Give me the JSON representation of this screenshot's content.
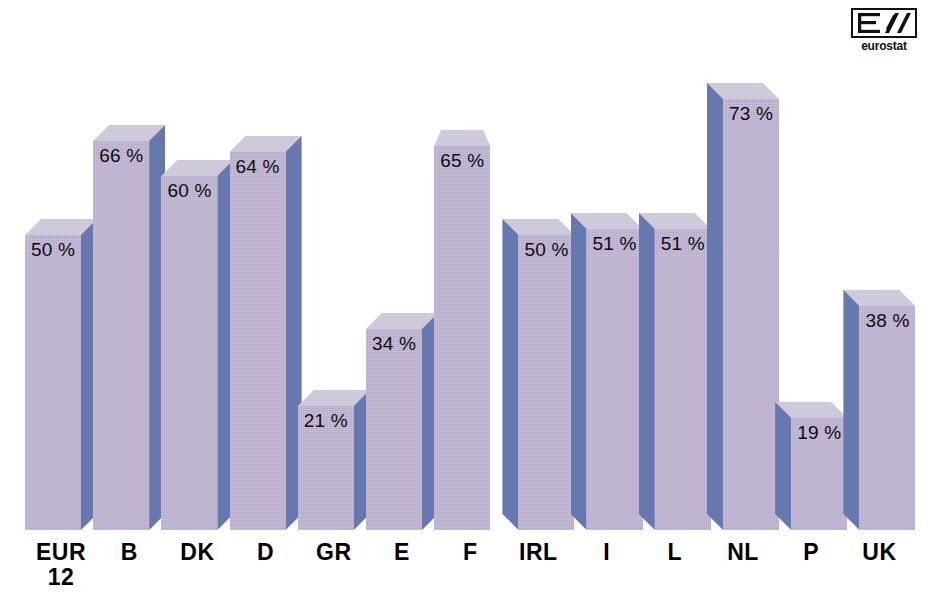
{
  "chart_data": {
    "type": "bar",
    "title": "",
    "subtitle": "",
    "xlabel": "",
    "ylabel": "",
    "ylim": [
      0,
      80
    ],
    "grid": false,
    "legend": null,
    "value_suffix": "%",
    "categories": [
      "EUR 12",
      "B",
      "DK",
      "D",
      "GR",
      "E",
      "F",
      "IRL",
      "I",
      "L",
      "NL",
      "P",
      "UK"
    ],
    "values": [
      50,
      66,
      60,
      64,
      21,
      34,
      65,
      50,
      51,
      51,
      73,
      19,
      38
    ],
    "data_labels": [
      "50 %",
      "66 %",
      "60 %",
      "64 %",
      "21 %",
      "34 %",
      "65 %",
      "50 %",
      "51 %",
      "51 %",
      "73 %",
      "19 %",
      "38 %"
    ],
    "bars": [
      {
        "category_line1": "EUR",
        "category_line2": "12",
        "value": 50,
        "label": "50 %",
        "side": "right"
      },
      {
        "category_line1": "B",
        "category_line2": "",
        "value": 66,
        "label": "66 %",
        "side": "right"
      },
      {
        "category_line1": "DK",
        "category_line2": "",
        "value": 60,
        "label": "60 %",
        "side": "right"
      },
      {
        "category_line1": "D",
        "category_line2": "",
        "value": 64,
        "label": "64 %",
        "side": "right"
      },
      {
        "category_line1": "GR",
        "category_line2": "",
        "value": 21,
        "label": "21 %",
        "side": "right"
      },
      {
        "category_line1": "E",
        "category_line2": "",
        "value": 34,
        "label": "34 %",
        "side": "right"
      },
      {
        "category_line1": "F",
        "category_line2": "",
        "value": 65,
        "label": "65 %",
        "side": "none"
      },
      {
        "category_line1": "IRL",
        "category_line2": "",
        "value": 50,
        "label": "50 %",
        "side": "left"
      },
      {
        "category_line1": "I",
        "category_line2": "",
        "value": 51,
        "label": "51 %",
        "side": "left"
      },
      {
        "category_line1": "L",
        "category_line2": "",
        "value": 51,
        "label": "51 %",
        "side": "left"
      },
      {
        "category_line1": "NL",
        "category_line2": "",
        "value": 73,
        "label": "73 %",
        "side": "left"
      },
      {
        "category_line1": "P",
        "category_line2": "",
        "value": 19,
        "label": "19 %",
        "side": "left"
      },
      {
        "category_line1": "UK",
        "category_line2": "",
        "value": 38,
        "label": "38 %",
        "side": "left"
      }
    ],
    "colors": {
      "bar_front": "#b5a9c9",
      "bar_side": "#6778ae",
      "bar_top": "#cfc9dc",
      "label_text": "#0d0d0d",
      "category_text": "#000000",
      "background": "#ffffff"
    }
  },
  "logo": {
    "name": "eurostat-logo",
    "wordmark": "eurostat",
    "mark_glyph": "E/"
  }
}
